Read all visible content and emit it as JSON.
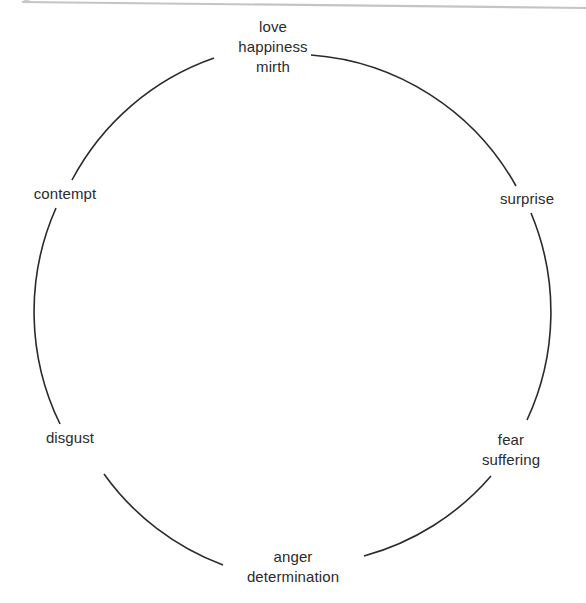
{
  "diagram": {
    "type": "emotion-circle",
    "circle": {
      "cx": 292,
      "cy": 310,
      "r": 256,
      "stroke": "#2a2a2a"
    },
    "nodes": [
      {
        "id": "top",
        "lines": [
          "love",
          "happiness",
          "mirth"
        ]
      },
      {
        "id": "upper-right",
        "lines": [
          "surprise"
        ]
      },
      {
        "id": "lower-right",
        "lines": [
          "fear",
          "suffering"
        ]
      },
      {
        "id": "bottom",
        "lines": [
          "anger",
          "determination"
        ]
      },
      {
        "id": "lower-left",
        "lines": [
          "disgust"
        ]
      },
      {
        "id": "upper-left",
        "lines": [
          "contempt"
        ]
      }
    ]
  }
}
